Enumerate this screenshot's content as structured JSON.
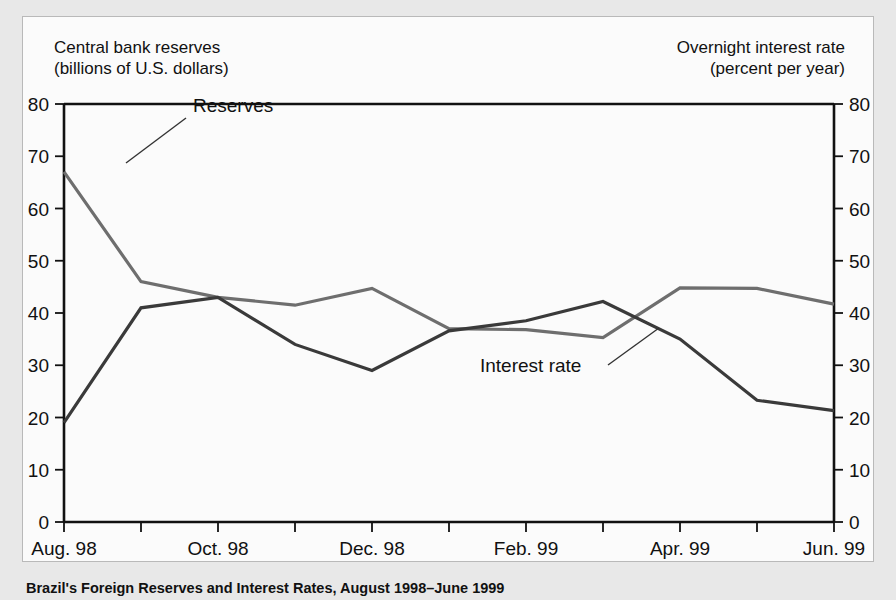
{
  "figure": {
    "left_axis_title": "Central bank reserves\n(billions of U.S. dollars)",
    "right_axis_title": "Overnight interest rate\n(percent per year)",
    "caption": "Brazil's Foreign Reserves and Interest Rates, August 1998–June 1999"
  },
  "chart_data": {
    "type": "line",
    "title": "Brazil's Foreign Reserves and Interest Rates, August 1998–June 1999",
    "xlabel": "",
    "ylabel": "Central bank reserves (billions of U.S. dollars)",
    "y2label": "Overnight interest rate (percent per year)",
    "ylim": [
      0,
      80
    ],
    "y2lim": [
      0,
      80
    ],
    "grid": false,
    "legend_position": "inline-annotations",
    "y_ticks": [
      0,
      10,
      20,
      30,
      40,
      50,
      60,
      70,
      80
    ],
    "y_tick_labels": [
      "0",
      "10",
      "20",
      "30",
      "40",
      "50",
      "60",
      "70",
      "80"
    ],
    "y2_ticks": [
      0,
      10,
      20,
      30,
      40,
      50,
      60,
      70,
      80
    ],
    "y2_tick_labels": [
      "0",
      "10",
      "20",
      "30",
      "40",
      "50",
      "60",
      "70",
      "80"
    ],
    "x": [
      "Aug. 98",
      "Sep. 98",
      "Oct. 98",
      "Nov. 98",
      "Dec. 98",
      "Jan. 99",
      "Feb. 99",
      "Mar. 99",
      "Apr. 99",
      "May 99",
      "Jun. 99"
    ],
    "x_tick_labels": [
      "Aug. 98",
      "",
      "Oct. 98",
      "",
      "Dec. 98",
      "",
      "Feb. 99",
      "",
      "Apr. 99",
      "",
      "Jun. 99"
    ],
    "x_labels_shown": [
      "Aug. 98",
      "Oct. 98",
      "Dec. 98",
      "Feb. 99",
      "Apr. 99",
      "Jun. 99"
    ],
    "series": [
      {
        "name": "Reserves",
        "axis": "left",
        "color": "#6e6e6e",
        "values": [
          67,
          46,
          43,
          41.5,
          44.7,
          37,
          36.8,
          35.3,
          44.8,
          44.7,
          41.7
        ]
      },
      {
        "name": "Interest rate",
        "axis": "right",
        "color": "#3a3a3a",
        "values": [
          19,
          41,
          43,
          34,
          29,
          36.6,
          38.5,
          42.2,
          35,
          23.3,
          21.3
        ]
      }
    ],
    "annotations": [
      {
        "text": "Reserves",
        "series": "Reserves"
      },
      {
        "text": "Interest rate",
        "series": "Interest rate"
      }
    ]
  }
}
